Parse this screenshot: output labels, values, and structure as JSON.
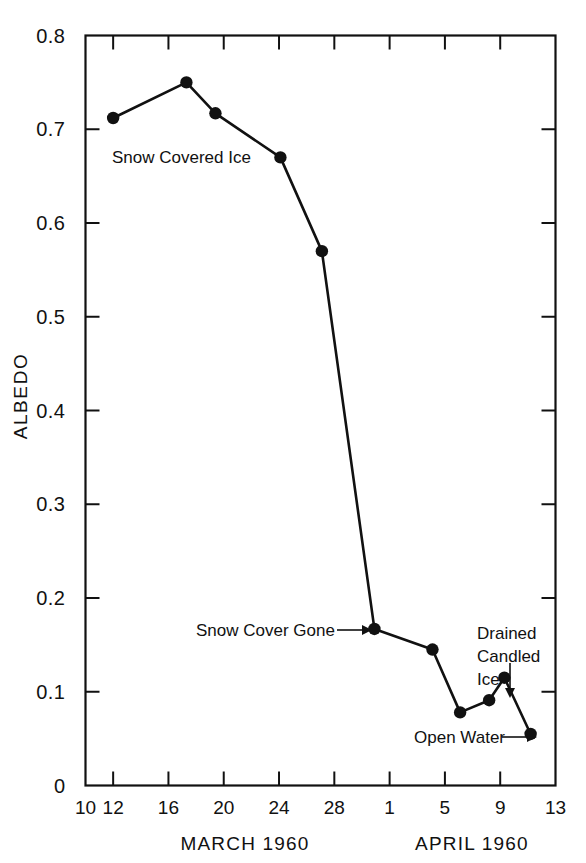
{
  "figure": {
    "background": "#ffffff",
    "ink_color": "#111111"
  },
  "chart_data": {
    "type": "line",
    "title": "",
    "subtitle": "",
    "xlabel": "",
    "ylabel": "ALBEDO",
    "xlim": [
      10,
      13.5
    ],
    "ylim": [
      0.0,
      0.8
    ],
    "grid": false,
    "legend_position": "none",
    "x_axis": {
      "label_left": "MARCH  1960",
      "label_right": "APRIL  1960",
      "tick_labels": [
        "10",
        "12",
        "16",
        "20",
        "24",
        "28",
        "1",
        "5",
        "9",
        "13"
      ],
      "tick_days": [
        10,
        12,
        16,
        20,
        24,
        28,
        32,
        36,
        40,
        44
      ],
      "note": "days 32..44 are April 1..13 continued from March 31 = day 31"
    },
    "y_axis": {
      "tick_labels": [
        "0",
        "0.1",
        "0.2",
        "0.3",
        "0.4",
        "0.5",
        "0.6",
        "0.7",
        "0.8"
      ],
      "tick_values": [
        0,
        0.1,
        0.2,
        0.3,
        0.4,
        0.5,
        0.6,
        0.7,
        0.8
      ]
    },
    "series": [
      {
        "name": "Albedo",
        "marker": "filled-circle",
        "color": "#111111",
        "x": [
          12.0,
          17.3,
          19.4,
          24.1,
          27.1,
          30.9,
          35.1,
          37.1,
          39.2,
          40.3,
          42.2
        ],
        "x_labels": [
          "March 12",
          "March 17",
          "March 19",
          "March 24",
          "March 27",
          "March 31",
          "April 4",
          "April 6",
          "April 8",
          "April 9",
          "April 11"
        ],
        "values": [
          0.712,
          0.75,
          0.717,
          0.67,
          0.57,
          0.167,
          0.145,
          0.078,
          0.091,
          0.115,
          0.055
        ]
      }
    ],
    "annotations": [
      {
        "id": "snow-covered-ice",
        "text": "Snow Covered Ice",
        "kind": "text",
        "x": 14.0,
        "y": 0.655
      },
      {
        "id": "snow-cover-gone",
        "text": "Snow Cover Gone",
        "kind": "arrow-right",
        "target_x": 30.9,
        "target_y": 0.167
      },
      {
        "id": "drained-candled-ice",
        "text": "Drained Candled Ice",
        "text_lines": [
          "Drained",
          "Candled",
          "Ice"
        ],
        "kind": "arrow-down",
        "target_x": 40.3,
        "target_y": 0.115
      },
      {
        "id": "open-water",
        "text": "Open Water",
        "kind": "arrow-right",
        "target_x": 42.2,
        "target_y": 0.055
      }
    ]
  }
}
